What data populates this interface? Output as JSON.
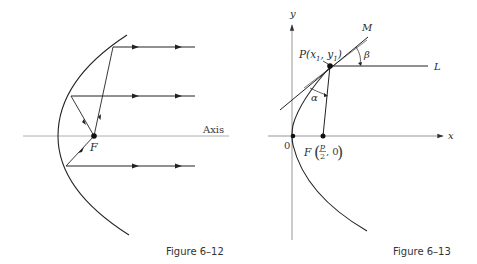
{
  "figures": [
    {
      "caption": "Figure 6–12",
      "labels": {
        "axis": "Axis",
        "focus": "F"
      },
      "description": "Parabolic reflector: rays from focus F reflect off the parabola and travel parallel to the axis"
    },
    {
      "caption": "Figure 6–13",
      "labels": {
        "y_axis": "y",
        "x_axis": "x",
        "origin": "0",
        "point_p": "P(x",
        "p_sub1": "1",
        "p_comma": ", y",
        "p_sub2": "1",
        "p_close": ")",
        "focus_f": "F",
        "focus_num": "p",
        "focus_den": "2",
        "focus_zero": ", 0",
        "line_m": "M",
        "line_l": "L",
        "angle_alpha": "α",
        "angle_beta": "β"
      },
      "description": "Parabola with tangent line PM at P(x1, y1), focus F(p/2, 0), line PL parallel to x-axis, angles α and β"
    }
  ],
  "colors": {
    "ink": "#2a2a2a",
    "axis": "#8a8a8a",
    "background": "#ffffff"
  }
}
